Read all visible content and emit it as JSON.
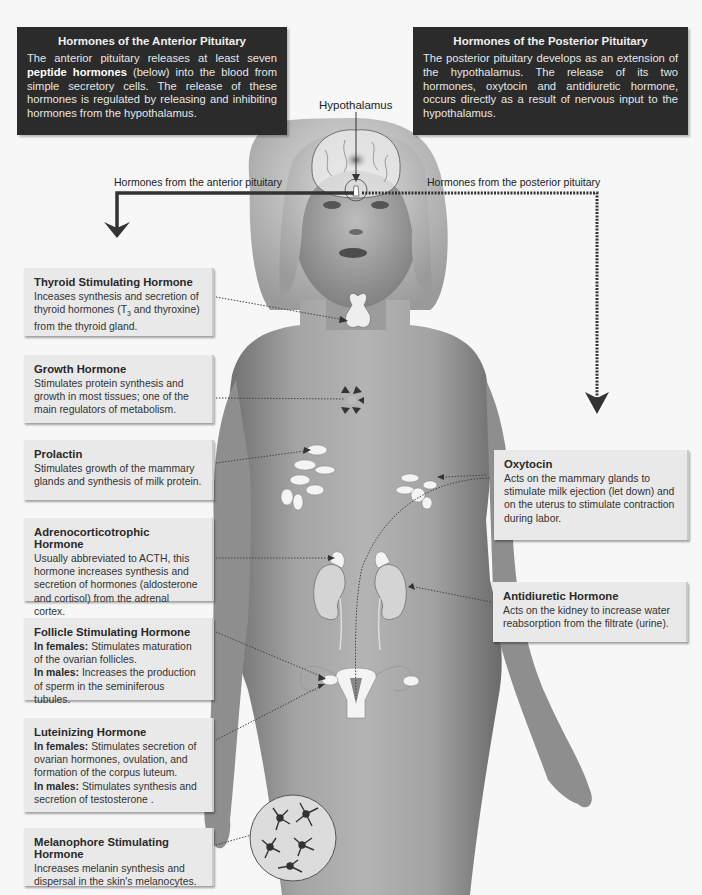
{
  "anterior_panel": {
    "title": "Hormones of the Anterior Pituitary",
    "body_pre": "The anterior pituitary releases at least seven ",
    "body_bold": "peptide hormones",
    "body_post": " (below) into the blood from simple secretory cells. The release of these hormones is regulated by releasing and inhibiting hormones from the hypothalamus."
  },
  "posterior_panel": {
    "title": "Hormones of the Posterior Pituitary",
    "body": "The posterior pituitary develops as an extension of the hypothalamus. The release of its two hormones, oxytocin and antidiuretic hormone, occurs directly as a result of nervous input to the hypothalamus."
  },
  "labels": {
    "hypothalamus": "Hypothalamus",
    "from_anterior": "Hormones from the anterior pituitary",
    "from_posterior": "Hormones from the posterior pituitary"
  },
  "anterior_hormones": [
    {
      "name": "Thyroid Stimulating Hormone",
      "text_pre": "Inceases synthesis and secretion of thyroid hormones (T",
      "text_sub": "3",
      "text_post": " and thyroxine) from the thyroid gland.",
      "target": "thyroid gland"
    },
    {
      "name": "Growth Hormone",
      "text": "Stimulates protein synthesis and growth in most tissues; one of the main regulators of metabolism.",
      "target": "body tissues"
    },
    {
      "name": "Prolactin",
      "text": "Stimulates growth of the mammary glands and synthesis of milk protein.",
      "target": "mammary glands"
    },
    {
      "name": "Adrenocorticotrophic Hormone",
      "text": "Usually abbreviated to ACTH, this hormone increases synthesis and secretion of hormones (aldosterone and cortisol) from the adrenal cortex.",
      "target": "adrenal cortex"
    },
    {
      "name": "Follicle Stimulating Hormone",
      "female_label": "In females:",
      "female_text": " Stimulates maturation of the ovarian follicles.",
      "male_label": "In males:",
      "male_text": " Increases the production of sperm in the seminiferous tubules.",
      "target": "ovaries"
    },
    {
      "name": "Luteinizing Hormone",
      "female_label": "In females:",
      "female_text": " Stimulates secretion of ovarian hormones, ovulation, and formation of the corpus luteum.",
      "male_label": "In males:",
      "male_text": " Stimulates synthesis and secretion of testosterone .",
      "target": "ovaries"
    },
    {
      "name": "Melanophore Stimulating Hormone",
      "text": "Increases melanin synthesis and dispersal in the skin's melanocytes.",
      "target": "skin melanocytes"
    }
  ],
  "posterior_hormones": [
    {
      "name": "Oxytocin",
      "text": "Acts on the mammary glands to stimulate milk ejection (let down) and on the uterus to stimulate contraction during labor.",
      "target": "mammary glands, uterus"
    },
    {
      "name": "Antidiuretic Hormone",
      "text": "Acts on the kidney to increase water reabsorption from the filtrate (urine).",
      "target": "kidney"
    }
  ],
  "colors": {
    "panel_dark": "#2b2b2b",
    "card_bg": "#e9e9e9",
    "background": "#f7f7f7",
    "arrow": "#333333",
    "skin": "#a9a9a9"
  }
}
